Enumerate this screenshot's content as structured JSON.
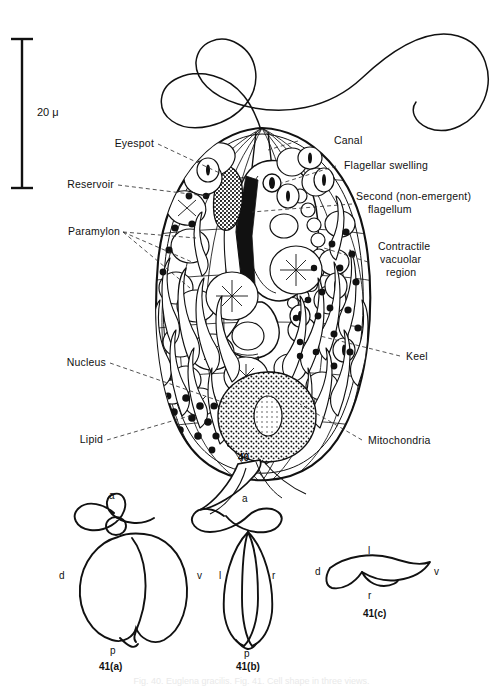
{
  "figure": {
    "main_number": "40",
    "scale_bar_label": "20 μ",
    "caption": "Fig. 40. Euglena gracilis. Fig. 41. Cell shape in three views."
  },
  "labels": {
    "eyespot": "Eyespot",
    "reservoir": "Reservoir",
    "paramylon": "Paramylon",
    "nucleus": "Nucleus",
    "lipid": "Lipid",
    "canal": "Canal",
    "flagellar_swelling": "Flagellar swelling",
    "second_flagellum_line1": "Second (non-emergent)",
    "second_flagellum_line2": "flagellum",
    "contractile_line1": "Contractile",
    "contractile_line2": "vacuolar",
    "contractile_line3": "region",
    "keel": "Keel",
    "mitochondria": "Mitochondria"
  },
  "sub_figures": [
    {
      "id": "41a",
      "number": "41(a)",
      "axis_labels": {
        "anterior": "a",
        "dorsal": "d",
        "ventral": "v",
        "posterior": "p"
      }
    },
    {
      "id": "41b",
      "number": "41(b)",
      "axis_labels": {
        "anterior": "a",
        "left": "l",
        "right": "r",
        "posterior": "p"
      }
    },
    {
      "id": "41c",
      "number": "41(c)",
      "axis_labels": {
        "left": "l",
        "dorsal": "d",
        "ventral": "v",
        "right": "r"
      }
    }
  ],
  "colors": {
    "ink": "#111111",
    "background": "#ffffff",
    "leader": "#333333"
  }
}
